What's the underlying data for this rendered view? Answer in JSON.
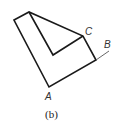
{
  "diagram": {
    "caption": "(b)",
    "labels": {
      "A": "A",
      "B": "B",
      "C": "C"
    },
    "colors": {
      "stroke": "#1a1a1a",
      "thin_stroke": "#555555",
      "label": "#333333"
    }
  }
}
